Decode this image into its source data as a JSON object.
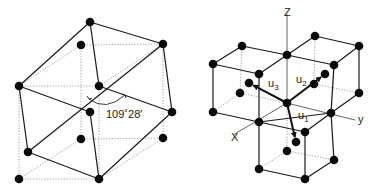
{
  "figure_left": {
    "title": "Tetrahedral bond angle in cubic cell",
    "angle_label": "109˚28′",
    "atoms": [
      [
        90,
        22
      ],
      [
        81,
        45
      ],
      [
        163,
        44
      ],
      [
        19,
        86
      ],
      [
        99,
        86
      ],
      [
        172,
        112
      ],
      [
        90,
        112
      ],
      [
        81,
        139
      ],
      [
        163,
        138
      ],
      [
        28,
        152
      ],
      [
        19,
        179
      ],
      [
        99,
        179
      ]
    ],
    "solid_edges": [
      [
        [
          90,
          22
        ],
        [
          163,
          44
        ]
      ],
      [
        [
          90,
          22
        ],
        [
          19,
          86
        ]
      ],
      [
        [
          90,
          22
        ],
        [
          99,
          86
        ]
      ],
      [
        [
          163,
          44
        ],
        [
          172,
          112
        ]
      ],
      [
        [
          19,
          86
        ],
        [
          28,
          152
        ]
      ],
      [
        [
          19,
          86
        ],
        [
          90,
          112
        ]
      ],
      [
        [
          99,
          86
        ],
        [
          172,
          112
        ]
      ],
      [
        [
          90,
          112
        ],
        [
          99,
          179
        ]
      ],
      [
        [
          172,
          112
        ],
        [
          99,
          179
        ]
      ],
      [
        [
          28,
          152
        ],
        [
          99,
          179
        ]
      ],
      [
        [
          28,
          152
        ],
        [
          163,
          44
        ]
      ]
    ],
    "dotted_edges": [
      [
        [
          81,
          45
        ],
        [
          163,
          44
        ]
      ],
      [
        [
          81,
          45
        ],
        [
          81,
          139
        ]
      ],
      [
        [
          19,
          86
        ],
        [
          99,
          86
        ]
      ],
      [
        [
          99,
          86
        ],
        [
          99,
          179
        ]
      ],
      [
        [
          163,
          44
        ],
        [
          163,
          138
        ]
      ],
      [
        [
          81,
          139
        ],
        [
          163,
          138
        ]
      ],
      [
        [
          19,
          86
        ],
        [
          19,
          179
        ]
      ],
      [
        [
          19,
          179
        ],
        [
          99,
          179
        ]
      ],
      [
        [
          81,
          139
        ],
        [
          19,
          179
        ]
      ],
      [
        [
          163,
          138
        ],
        [
          99,
          179
        ]
      ],
      [
        [
          81,
          45
        ],
        [
          19,
          86
        ]
      ],
      [
        [
          99,
          86
        ],
        [
          163,
          44
        ]
      ]
    ],
    "arc": {
      "from": [
        89,
        99
      ],
      "to": [
        125,
        95
      ],
      "ctrl": [
        106,
        112
      ]
    }
  },
  "figure_right": {
    "title": "Diamond lattice bond vectors",
    "axis_labels": {
      "z": "Z",
      "y": "y",
      "x": "X"
    },
    "vector_labels": {
      "u1": "u",
      "u1_sub": "1",
      "u2": "u",
      "u2_sub": "2",
      "u3": "u",
      "u3_sub": "3"
    },
    "center": [
      287,
      103
    ],
    "atoms": [
      [
        315,
        36
      ],
      [
        242,
        46
      ],
      [
        359,
        46
      ],
      [
        287,
        55
      ],
      [
        213,
        64
      ],
      [
        334,
        65
      ],
      [
        259,
        74
      ],
      [
        325,
        74
      ],
      [
        249,
        83
      ],
      [
        314,
        84
      ],
      [
        240,
        93
      ],
      [
        359,
        93
      ],
      [
        287,
        103
      ],
      [
        213,
        112
      ],
      [
        331,
        113
      ],
      [
        259,
        122
      ],
      [
        305,
        132
      ],
      [
        296,
        142
      ],
      [
        287,
        151
      ],
      [
        334,
        160
      ],
      [
        259,
        169
      ],
      [
        305,
        179
      ]
    ],
    "solid_edges": [
      [
        [
          242,
          46
        ],
        [
          287,
          55
        ]
      ],
      [
        [
          242,
          46
        ],
        [
          213,
          64
        ]
      ],
      [
        [
          213,
          64
        ],
        [
          259,
          74
        ]
      ],
      [
        [
          287,
          55
        ],
        [
          259,
          74
        ]
      ],
      [
        [
          213,
          64
        ],
        [
          213,
          112
        ]
      ],
      [
        [
          259,
          74
        ],
        [
          259,
          122
        ]
      ],
      [
        [
          213,
          112
        ],
        [
          259,
          122
        ]
      ],
      [
        [
          315,
          36
        ],
        [
          359,
          46
        ]
      ],
      [
        [
          315,
          36
        ],
        [
          287,
          55
        ]
      ],
      [
        [
          287,
          55
        ],
        [
          334,
          65
        ]
      ],
      [
        [
          359,
          46
        ],
        [
          334,
          65
        ]
      ],
      [
        [
          359,
          46
        ],
        [
          359,
          93
        ]
      ],
      [
        [
          334,
          65
        ],
        [
          331,
          113
        ]
      ],
      [
        [
          359,
          93
        ],
        [
          331,
          113
        ]
      ],
      [
        [
          259,
          122
        ],
        [
          331,
          113
        ]
      ],
      [
        [
          259,
          122
        ],
        [
          259,
          169
        ]
      ],
      [
        [
          305,
          132
        ],
        [
          305,
          179
        ]
      ],
      [
        [
          259,
          169
        ],
        [
          305,
          179
        ]
      ],
      [
        [
          334,
          160
        ],
        [
          305,
          179
        ]
      ],
      [
        [
          331,
          113
        ],
        [
          334,
          160
        ]
      ],
      [
        [
          259,
          122
        ],
        [
          305,
          132
        ]
      ],
      [
        [
          331,
          113
        ],
        [
          305,
          132
        ]
      ]
    ],
    "dotted_edges": [
      [
        [
          242,
          46
        ],
        [
          240,
          93
        ]
      ],
      [
        [
          315,
          36
        ],
        [
          314,
          84
        ]
      ],
      [
        [
          240,
          93
        ],
        [
          213,
          112
        ]
      ],
      [
        [
          240,
          93
        ],
        [
          287,
          103
        ]
      ],
      [
        [
          314,
          84
        ],
        [
          359,
          93
        ]
      ],
      [
        [
          314,
          84
        ],
        [
          287,
          103
        ]
      ],
      [
        [
          287,
          103
        ],
        [
          287,
          151
        ]
      ],
      [
        [
          287,
          151
        ],
        [
          259,
          169
        ]
      ],
      [
        [
          287,
          151
        ],
        [
          334,
          160
        ]
      ]
    ],
    "axes": {
      "z": [
        [
          287,
          14
        ],
        [
          287,
          103
        ]
      ],
      "y": [
        [
          287,
          103
        ],
        [
          355,
          120
        ]
      ],
      "x": [
        [
          287,
          103
        ],
        [
          233,
          135
        ]
      ]
    },
    "vectors": [
      {
        "name": "u1",
        "to": [
          296,
          142
        ]
      },
      {
        "name": "u2",
        "to": [
          325,
          74
        ]
      },
      {
        "name": "u3",
        "to": [
          249,
          83
        ]
      }
    ]
  }
}
